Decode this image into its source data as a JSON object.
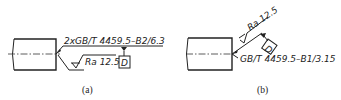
{
  "figure_a": {
    "caption": "(a)",
    "callout": "2xGB/T 4459.5–B2/6.3",
    "roughness": "Ra 12.5",
    "datum": "D"
  },
  "figure_b": {
    "caption": "(b)",
    "callout": "GB/T 4459.5–B1/3.15",
    "roughness": "Ra 12.5",
    "datum": "D"
  }
}
